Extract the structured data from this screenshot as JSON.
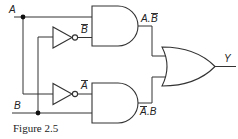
{
  "diagram": {
    "type": "logic-circuit",
    "caption": "Figure 2.5",
    "inputs": [
      {
        "name": "A",
        "label": "A"
      },
      {
        "name": "B",
        "label": "B"
      }
    ],
    "inverters": [
      {
        "input": "B",
        "output_label": "B̄",
        "output_label_base": "B"
      },
      {
        "input": "A",
        "output_label": "Ā",
        "output_label_base": "A"
      }
    ],
    "and_gates": [
      {
        "inputs": [
          "A",
          "B̄"
        ],
        "output_label": "A.B̄",
        "label_left": "A.",
        "label_bar": "B"
      },
      {
        "inputs": [
          "Ā",
          "B"
        ],
        "output_label": "Ā.B",
        "label_bar": "A",
        "label_right": ".B"
      }
    ],
    "or_gate": {
      "inputs": [
        "A.B̄",
        "Ā.B"
      ],
      "output_label": "Y"
    },
    "output": {
      "label": "Y"
    },
    "colors": {
      "line": "#333333",
      "background": "#ffffff"
    }
  }
}
